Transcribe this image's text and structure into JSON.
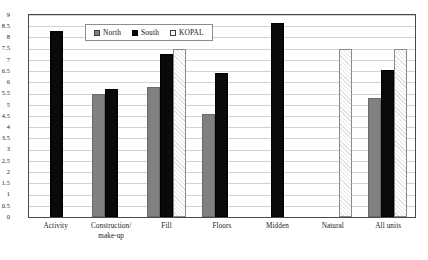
{
  "chart_data": {
    "type": "bar",
    "title": "",
    "xlabel": "",
    "ylabel": "",
    "ylim": [
      0,
      9
    ],
    "ytick_step": 0.5,
    "grid": true,
    "legend_position": "top-center-inside",
    "categories": [
      "Activity",
      "Construction/make-up",
      "Fill",
      "Floors",
      "Midden",
      "Natural",
      "All units"
    ],
    "category_lines": [
      [
        "Activity",
        ""
      ],
      [
        "Construction/",
        "make-up"
      ],
      [
        "Fill",
        ""
      ],
      [
        "Floors",
        ""
      ],
      [
        "Midden",
        ""
      ],
      [
        "Natural",
        ""
      ],
      [
        "All units",
        ""
      ]
    ],
    "series": [
      {
        "name": "North",
        "color": "#808080",
        "values": [
          null,
          5.5,
          5.8,
          4.6,
          null,
          null,
          5.3
        ]
      },
      {
        "name": "South",
        "color": "#0a0a0a",
        "values": [
          8.3,
          5.7,
          7.25,
          6.4,
          8.65,
          null,
          6.55
        ]
      },
      {
        "name": "KOPAL",
        "color": "#f2f2f2",
        "values": [
          null,
          null,
          7.47,
          null,
          null,
          7.5,
          7.5
        ]
      }
    ],
    "ytick_labels": [
      "9",
      "8.5",
      "8",
      "7.5",
      "7",
      "6.5",
      "6",
      "5.5",
      "5",
      "4.5",
      "4",
      "3.5",
      "3",
      "2.5",
      "2",
      "1.5",
      "1",
      "0.5",
      "0"
    ]
  },
  "legend": {
    "items": [
      {
        "label": "North",
        "swatch": "north-swatch"
      },
      {
        "label": "South",
        "swatch": "south-swatch"
      },
      {
        "label": "KOPAL",
        "swatch": "kopal-swatch"
      }
    ]
  },
  "colors": {
    "north": "#808080",
    "south": "#0a0a0a",
    "kopal": "#f2f2f2",
    "grid": "#d2d2d2",
    "frame": "#4a4a4a"
  }
}
